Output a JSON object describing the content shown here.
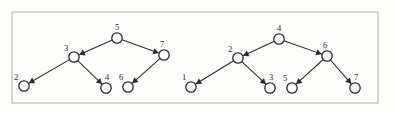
{
  "figure": {
    "background_color": "#fdfdfc",
    "frame": {
      "stroke_color": "#b9b9b5",
      "x": 12,
      "y": 12,
      "width": 366,
      "height": 91
    },
    "node_style": {
      "radius": 5.2,
      "fill_color": "#ffffff",
      "stroke_color": "#2b2b2b"
    },
    "edge_style": {
      "stroke_color": "#2b2b2b",
      "arrow": "filled-triangle"
    },
    "diagrams": [
      {
        "name": "left-tree",
        "nodes": [
          {
            "id": "L5",
            "label": "5",
            "x": 117,
            "y": 38,
            "label_dx": 0,
            "label_dy": -8
          },
          {
            "id": "L3",
            "label": "3",
            "x": 74,
            "y": 57,
            "label_dx": -8,
            "label_dy": -6
          },
          {
            "id": "L7",
            "label": "7",
            "x": 164,
            "y": 55,
            "label_dx": -2,
            "label_dy": -8
          },
          {
            "id": "L2",
            "label": "2",
            "x": 24,
            "y": 86,
            "label_dx": -8,
            "label_dy": -6
          },
          {
            "id": "L4",
            "label": "4",
            "x": 106,
            "y": 88,
            "label_dx": 1,
            "label_dy": -8
          },
          {
            "id": "L6",
            "label": "6",
            "x": 128,
            "y": 87,
            "label_dx": -7,
            "label_dy": -7
          }
        ],
        "edges": [
          {
            "from": "L5",
            "to": "L3",
            "arrow_at": "to"
          },
          {
            "from": "L5",
            "to": "L7",
            "arrow_at": "to"
          },
          {
            "from": "L3",
            "to": "L2",
            "arrow_at": "to"
          },
          {
            "from": "L3",
            "to": "L4",
            "arrow_at": "to"
          },
          {
            "from": "L7",
            "to": "L6",
            "arrow_at": "to"
          }
        ]
      },
      {
        "name": "right-tree",
        "nodes": [
          {
            "id": "R4",
            "label": "4",
            "x": 279,
            "y": 39,
            "label_dx": 0,
            "label_dy": -8
          },
          {
            "id": "R2",
            "label": "2",
            "x": 238,
            "y": 58,
            "label_dx": -8,
            "label_dy": -6
          },
          {
            "id": "R6",
            "label": "6",
            "x": 327,
            "y": 56,
            "label_dx": -2,
            "label_dy": -8
          },
          {
            "id": "R1",
            "label": "1",
            "x": 191,
            "y": 87,
            "label_dx": -7,
            "label_dy": -7
          },
          {
            "id": "R3",
            "label": "3",
            "x": 270,
            "y": 88,
            "label_dx": 1,
            "label_dy": -8
          },
          {
            "id": "R5",
            "label": "5",
            "x": 292,
            "y": 88,
            "label_dx": -7,
            "label_dy": -7
          },
          {
            "id": "R7",
            "label": "7",
            "x": 355,
            "y": 88,
            "label_dx": 1,
            "label_dy": -8
          }
        ],
        "edges": [
          {
            "from": "R4",
            "to": "R2",
            "arrow_at": "to"
          },
          {
            "from": "R4",
            "to": "R6",
            "arrow_at": "to"
          },
          {
            "from": "R2",
            "to": "R1",
            "arrow_at": "to"
          },
          {
            "from": "R2",
            "to": "R3",
            "arrow_at": "to"
          },
          {
            "from": "R6",
            "to": "R5",
            "arrow_at": "to"
          },
          {
            "from": "R6",
            "to": "R7",
            "arrow_at": "to"
          }
        ]
      }
    ]
  }
}
